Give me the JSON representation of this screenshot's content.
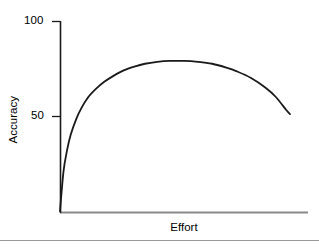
{
  "chart_data": {
    "type": "line",
    "title": "",
    "subtitle": "",
    "xlabel": "Effort",
    "ylabel": "Accuracy",
    "xlim": [
      0,
      130
    ],
    "ylim": [
      0,
      100
    ],
    "xticks": [],
    "xtick_labels": [],
    "yticks": [
      50,
      100
    ],
    "ytick_labels": [
      "50",
      "100"
    ],
    "grid": false,
    "legend": null,
    "annotations": [],
    "series": [
      {
        "name": "accuracy-vs-effort",
        "color": "#1a1a1a",
        "line_width": 1.8,
        "x": [
          0,
          2,
          4,
          6,
          9,
          12,
          16,
          20,
          25,
          30,
          36,
          42,
          48,
          55,
          62,
          70,
          78,
          86,
          94,
          100,
          108,
          116,
          122,
          128,
          130
        ],
        "values": [
          0,
          21,
          32,
          40,
          48,
          54,
          60,
          64,
          68,
          71,
          74,
          76,
          77.5,
          78.5,
          79,
          79,
          78.5,
          77.5,
          75.5,
          73.5,
          70,
          65,
          60,
          53,
          51
        ]
      }
    ],
    "peak": {
      "x": 62,
      "y": 79
    },
    "start_point": {
      "x": 0,
      "y": 0
    },
    "end_point": {
      "x": 130,
      "y": 51
    }
  },
  "axes": {
    "y_axis_name": "y-axis-line",
    "x_axis_name": "x-axis-line",
    "y_axis_color": "#1a1a1a",
    "x_axis_color": "#8a8a8a"
  },
  "figure": {
    "background_color": "#ffffff",
    "rule_color": "#9a9a9a"
  }
}
